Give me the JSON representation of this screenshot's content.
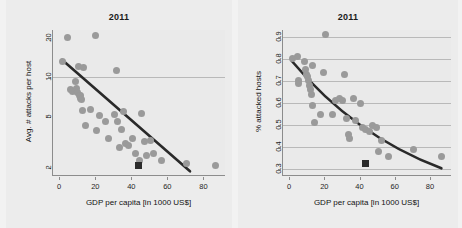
{
  "figure": {
    "background_color": "#f2f2f2",
    "panel_color": "#ececec",
    "point_color": "#9a9a9a",
    "fit_color": "#2a2a2a",
    "highlight_color": "#2b2b2b"
  },
  "chart_data": [
    {
      "id": "left",
      "type": "scatter",
      "title": "2011",
      "xlabel": "GDP per capita [in 1000 US$]",
      "ylabel": "Avg. # attacks per host",
      "xlim": [
        -4,
        92
      ],
      "ylim": [
        1.75,
        23
      ],
      "yscale": "log",
      "xticks": [
        0,
        20,
        40,
        60,
        80
      ],
      "xticklabels": [
        "0",
        "20",
        "40",
        "60",
        "80"
      ],
      "yticks": [
        2,
        5,
        10,
        20
      ],
      "yticklabels": [
        "2",
        "5",
        "10",
        "20"
      ],
      "gridlines_y": [
        10
      ],
      "grid": "y-only",
      "legend": "none",
      "points": [
        [
          1.5,
          13.2
        ],
        [
          4.0,
          20.0
        ],
        [
          5.5,
          8.0
        ],
        [
          7.0,
          7.8
        ],
        [
          8.5,
          9.3
        ],
        [
          9.0,
          8.2
        ],
        [
          9.5,
          7.6
        ],
        [
          10.0,
          12.0
        ],
        [
          10.5,
          7.3
        ],
        [
          11.0,
          7.2
        ],
        [
          11.5,
          6.9
        ],
        [
          12.0,
          6.8
        ],
        [
          12.5,
          5.6
        ],
        [
          13.0,
          11.9
        ],
        [
          14.0,
          4.3
        ],
        [
          17.0,
          5.7
        ],
        [
          19.5,
          21.0
        ],
        [
          20.0,
          3.9
        ],
        [
          22.0,
          5.1
        ],
        [
          25.0,
          4.6
        ],
        [
          27.0,
          3.4
        ],
        [
          30.0,
          5.2
        ],
        [
          31.0,
          11.3
        ],
        [
          32.0,
          4.6
        ],
        [
          33.0,
          2.9
        ],
        [
          34.0,
          4.0
        ],
        [
          35.0,
          5.5
        ],
        [
          36.0,
          3.1
        ],
        [
          38.0,
          3.0
        ],
        [
          40.0,
          3.4
        ],
        [
          42.0,
          2.6
        ],
        [
          44.0,
          2.3
        ],
        [
          45.0,
          5.3
        ],
        [
          47.0,
          3.2
        ],
        [
          48.0,
          2.5
        ],
        [
          50.0,
          3.3
        ],
        [
          52.0,
          2.6
        ],
        [
          56.0,
          2.3
        ],
        [
          70.0,
          2.2
        ],
        [
          86.0,
          2.1
        ]
      ],
      "highlight_point": [
        43.5,
        2.1
      ],
      "fit_line": {
        "kind": "linear-on-log-y",
        "x_start": 1.0,
        "y_start": 13.6,
        "x_end": 72.0,
        "y_end": 1.9
      }
    },
    {
      "id": "right",
      "type": "scatter",
      "title": "2011",
      "xlabel": "GDP per capita [in 1000 US$]",
      "ylabel": "% attacked hosts",
      "xlim": [
        -4,
        92
      ],
      "ylim": [
        0.27,
        0.93
      ],
      "yscale": "linear",
      "xticks": [
        0,
        20,
        40,
        60,
        80
      ],
      "xticklabels": [
        "0",
        "20",
        "40",
        "60",
        "80"
      ],
      "yticks": [
        0.3,
        0.4,
        0.5,
        0.6,
        0.7,
        0.8,
        0.9
      ],
      "yticklabels": [
        "0.3",
        "0.4",
        "0.5",
        "0.6",
        "0.7",
        "0.8",
        "0.9"
      ],
      "gridlines_y": [
        0.3,
        0.4,
        0.5,
        0.6,
        0.7,
        0.8,
        0.9
      ],
      "grid": "y-only",
      "legend": "none",
      "points": [
        [
          1.5,
          0.8
        ],
        [
          4.0,
          0.81
        ],
        [
          4.5,
          0.7
        ],
        [
          5.0,
          0.69
        ],
        [
          8.0,
          0.79
        ],
        [
          9.0,
          0.75
        ],
        [
          9.5,
          0.73
        ],
        [
          10.0,
          0.72
        ],
        [
          10.5,
          0.7
        ],
        [
          11.0,
          0.68
        ],
        [
          11.5,
          0.66
        ],
        [
          12.0,
          0.64
        ],
        [
          12.5,
          0.59
        ],
        [
          13.0,
          0.77
        ],
        [
          14.0,
          0.51
        ],
        [
          17.5,
          0.55
        ],
        [
          19.0,
          0.74
        ],
        [
          20.0,
          0.91
        ],
        [
          24.0,
          0.55
        ],
        [
          26.0,
          0.61
        ],
        [
          28.0,
          0.62
        ],
        [
          30.0,
          0.61
        ],
        [
          31.0,
          0.73
        ],
        [
          32.0,
          0.53
        ],
        [
          33.0,
          0.46
        ],
        [
          34.0,
          0.44
        ],
        [
          36.0,
          0.62
        ],
        [
          37.0,
          0.52
        ],
        [
          40.0,
          0.6
        ],
        [
          41.0,
          0.49
        ],
        [
          43.0,
          0.48
        ],
        [
          45.0,
          0.47
        ],
        [
          47.0,
          0.5
        ],
        [
          49.0,
          0.49
        ],
        [
          50.0,
          0.38
        ],
        [
          52.0,
          0.43
        ],
        [
          56.0,
          0.36
        ],
        [
          70.0,
          0.39
        ],
        [
          86.0,
          0.36
        ]
      ],
      "highlight_point": [
        43.0,
        0.325
      ],
      "fit_line": {
        "kind": "exponential-decay",
        "x_start": 1.0,
        "y_start": 0.79,
        "x_end": 86.0,
        "y_end": 0.305,
        "x_mid": 40.0,
        "y_mid": 0.5
      }
    }
  ]
}
